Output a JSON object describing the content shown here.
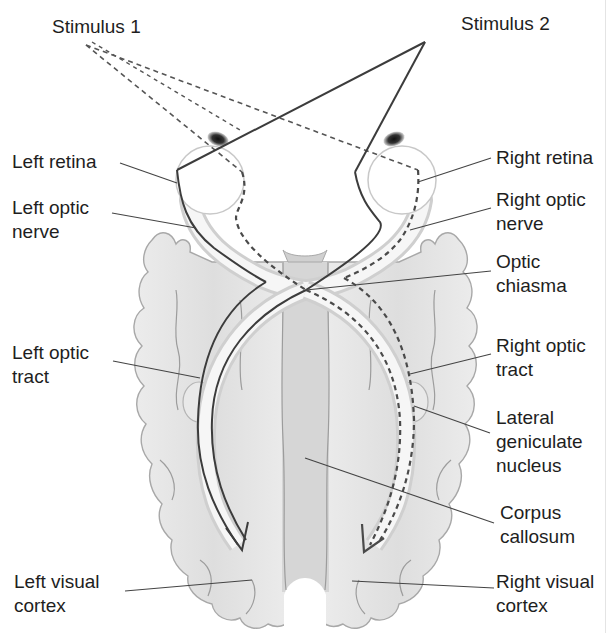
{
  "title_cropped": "",
  "stimuli": {
    "stimulus_1": "Stimulus 1",
    "stimulus_2": "Stimulus 2"
  },
  "labels": {
    "left_retina": "Left retina",
    "left_optic_nerve": [
      "Left optic",
      "nerve"
    ],
    "left_optic_tract": [
      "Left optic",
      "tract"
    ],
    "left_visual_cortex": [
      "Left visual",
      "cortex"
    ],
    "right_retina": "Right retina",
    "right_optic_nerve": [
      "Right optic",
      "nerve"
    ],
    "optic_chiasma": [
      "Optic",
      "chiasma"
    ],
    "right_optic_tract": [
      "Right optic",
      "tract"
    ],
    "lateral_geniculate_nucleus": [
      "Lateral",
      "geniculate",
      "nucleus"
    ],
    "corpus_callosum": [
      "Corpus",
      "callosum"
    ],
    "right_visual_cortex": [
      "Right visual",
      "cortex"
    ]
  },
  "legend": {
    "solid_pathway": "Stimulus 2 path (solid line) to left visual cortex",
    "dashed_pathway": "Stimulus 1 path (dashed line) to right visual cortex"
  },
  "colors": {
    "brain_fill": "#e6e6e6",
    "brain_stroke": "#a8a8a8",
    "pathway": "#3c3c3c",
    "text": "#1e1e1e"
  }
}
